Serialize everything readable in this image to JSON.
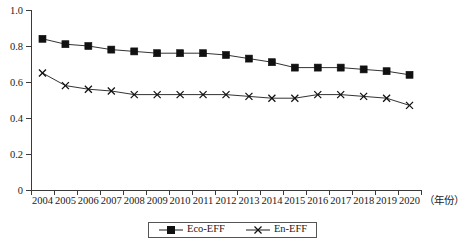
{
  "chart_data": {
    "type": "line",
    "title": "",
    "xlabel": "（年份）",
    "ylabel": "",
    "grid": false,
    "legend_position": "bottom-center",
    "xlim": [
      2004,
      2020
    ],
    "ylim": [
      0,
      1.0
    ],
    "ytick_labels": [
      "1.0",
      "0.8",
      "0.6",
      "0.4",
      "0.2",
      "0"
    ],
    "ytick_values": [
      1.0,
      0.8,
      0.6,
      0.4,
      0.2,
      0
    ],
    "categories": [
      "2004",
      "2005",
      "2006",
      "2007",
      "2008",
      "2009",
      "2010",
      "2011",
      "2012",
      "2013",
      "2014",
      "2015",
      "2016",
      "2017",
      "2018",
      "2019",
      "2020"
    ],
    "series": [
      {
        "name": "Eco-EFF",
        "marker": "filled-square",
        "values": [
          0.84,
          0.81,
          0.8,
          0.78,
          0.77,
          0.76,
          0.76,
          0.76,
          0.75,
          0.73,
          0.71,
          0.68,
          0.68,
          0.68,
          0.67,
          0.66,
          0.64
        ]
      },
      {
        "name": "En-EFF",
        "marker": "cross",
        "values": [
          0.65,
          0.58,
          0.56,
          0.55,
          0.53,
          0.53,
          0.53,
          0.53,
          0.53,
          0.52,
          0.51,
          0.51,
          0.53,
          0.53,
          0.52,
          0.51,
          0.47
        ]
      }
    ]
  },
  "legend": {
    "items": [
      {
        "label": "Eco-EFF",
        "marker": "filled-square"
      },
      {
        "label": "En-EFF",
        "marker": "cross"
      }
    ]
  },
  "colors": {
    "series_line": "#1c1c1c",
    "marker": "#111111",
    "axis": "#3a3a3a",
    "text": "#1a1a1a",
    "background": "#ffffff"
  }
}
